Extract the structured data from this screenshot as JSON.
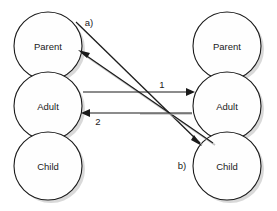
{
  "diagram": {
    "type": "transactional-analysis-pac",
    "background_color": "#ffffff",
    "stroke_color": "#1a1a1a",
    "shadow_color": "#b9b9b9",
    "columns": [
      {
        "id": "left",
        "role": "agent",
        "center_x": 48,
        "circle_radius": 34,
        "states": [
          {
            "id": "left-parent",
            "label": "Parent",
            "center_y": 46
          },
          {
            "id": "left-adult",
            "label": "Adult",
            "center_y": 106
          },
          {
            "id": "left-child",
            "label": "Child",
            "center_y": 166
          }
        ]
      },
      {
        "id": "right",
        "role": "respondent",
        "center_x": 227,
        "circle_radius": 34,
        "states": [
          {
            "id": "right-parent",
            "label": "Parent",
            "center_y": 46
          },
          {
            "id": "right-adult",
            "label": "Adult",
            "center_y": 106
          },
          {
            "id": "right-child",
            "label": "Child",
            "center_y": 166
          }
        ]
      }
    ],
    "arrows": [
      {
        "id": "arrow-1",
        "label": "1",
        "label_x": 162,
        "label_y": 85,
        "from": "left-adult",
        "to": "right-adult",
        "kind": "complementary",
        "direction": "left-to-right",
        "x1": 83,
        "y1": 92,
        "x2": 193,
        "y2": 92
      },
      {
        "id": "arrow-2",
        "label": "2",
        "label_x": 98,
        "label_y": 122,
        "from": "right-adult",
        "to": "left-adult",
        "kind": "complementary",
        "direction": "right-to-left",
        "x1": 193,
        "y1": 113,
        "x2": 83,
        "y2": 113
      },
      {
        "id": "arrow-a",
        "label": "a)",
        "label_x": 89,
        "label_y": 23,
        "from": "right-child",
        "to": "left-parent",
        "kind": "crossed",
        "direction": "lower-right-to-upper-left",
        "x1": 213,
        "y1": 143,
        "x2": 79,
        "y2": 51
      },
      {
        "id": "arrow-b",
        "label": "b)",
        "label_x": 182,
        "label_y": 166,
        "from": "left-parent",
        "to": "right-child",
        "kind": "crossed",
        "direction": "upper-left-to-lower-right",
        "x1": 76,
        "y1": 22,
        "x2": 202,
        "y2": 145
      }
    ]
  }
}
